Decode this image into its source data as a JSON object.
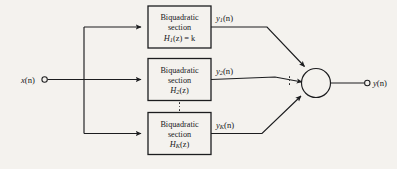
{
  "figure": {
    "kind": "block-diagram",
    "background_color": "#f4f2ee",
    "ink_color": "#1c1d1f"
  },
  "input": {
    "label_var": "x",
    "label_arg": "(n)",
    "terminal": "open-circle-terminal"
  },
  "output": {
    "label_var": "y",
    "label_arg": "(n)",
    "terminal": "open-circle-terminal"
  },
  "summing_node": {
    "shape": "circle",
    "label": ""
  },
  "sections": [
    {
      "title_line1": "Biquadratic",
      "title_line2": "section",
      "formula_var": "H",
      "formula_sub": "1",
      "formula_rest": "(z)",
      "formula_tail": " = k",
      "out_var": "y",
      "out_sub": "1",
      "out_arg": "(n)"
    },
    {
      "title_line1": "Biquadratic",
      "title_line2": "section",
      "formula_var": "H",
      "formula_sub": "2",
      "formula_rest": "(z)",
      "formula_tail": "",
      "out_var": "y",
      "out_sub": "2",
      "out_arg": "(n)"
    },
    {
      "title_line1": "Biquadratic",
      "title_line2": "section",
      "formula_var": "H",
      "formula_sub": "K",
      "formula_rest": "(z)",
      "formula_tail": "",
      "out_var": "y",
      "out_sub": "K",
      "out_arg": "(n)"
    }
  ],
  "ellipses": [
    {
      "name": "sections-ellipsis",
      "dots": 3
    },
    {
      "name": "summing-inputs-ellipsis",
      "dots": 3
    }
  ]
}
